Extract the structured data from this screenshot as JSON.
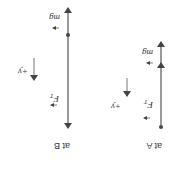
{
  "figure": {
    "rotation_deg": 180,
    "panels": [
      {
        "id": "A",
        "caption": "at A",
        "forces": [
          {
            "label": "F",
            "subscript": "T",
            "direction": "up"
          },
          {
            "label": "mg",
            "direction": "down"
          }
        ],
        "axis": {
          "label": "+y",
          "direction": "up"
        }
      },
      {
        "id": "B",
        "caption": "at B",
        "forces": [
          {
            "label": "F",
            "subscript": "T",
            "direction": "up"
          },
          {
            "label": "mg",
            "direction": "down"
          }
        ],
        "axis": {
          "label": "+y",
          "direction": "up"
        }
      }
    ],
    "colors": {
      "line": "#555555",
      "text": "#333333",
      "background": "#ffffff"
    }
  }
}
